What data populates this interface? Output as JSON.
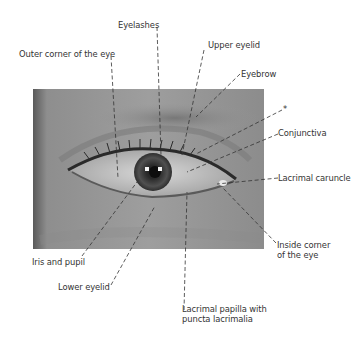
{
  "figure": {
    "photo": {
      "style": "grayscale close-up photograph of a left eye region",
      "bg": "#9a9a9a"
    },
    "line_color": "#333333",
    "labels": [
      {
        "id": "eyelashes",
        "text": "Eyelashes"
      },
      {
        "id": "outer-corner",
        "text": "Outer corner of the eye"
      },
      {
        "id": "upper-eyelid",
        "text": "Upper eyelid"
      },
      {
        "id": "eyebrow",
        "text": "Eyebrow"
      },
      {
        "id": "asterisk",
        "text": "*"
      },
      {
        "id": "conjunctiva",
        "text": "Conjunctiva"
      },
      {
        "id": "lacrimal-caruncle",
        "text": "Lacrimal caruncle"
      },
      {
        "id": "inside-corner",
        "text": "Inside corner\nof the eye"
      },
      {
        "id": "iris-pupil",
        "text": "Iris and pupil"
      },
      {
        "id": "lower-eyelid",
        "text": "Lower eyelid"
      },
      {
        "id": "lacrimal-papilla",
        "text": "Lacrimal papilla with\npuncta lacrimalia"
      }
    ]
  }
}
